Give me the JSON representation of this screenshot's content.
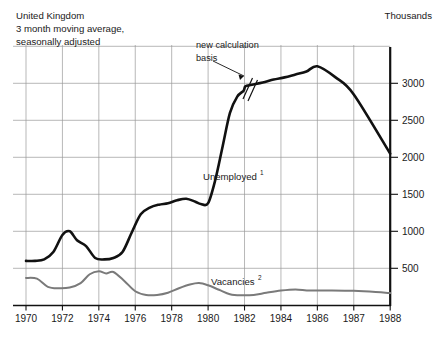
{
  "header": {
    "caption_lines": [
      "United Kingdom",
      "3 month moving average,",
      "seasonally adjusted"
    ],
    "units_label": "Thousands"
  },
  "annotations": [
    {
      "name": "new-calculation-basis",
      "line1": "new calculation",
      "line2": "basis",
      "marker": "axis-break-slashes",
      "points_to_year": 1982
    }
  ],
  "series_labels": {
    "unemployed": "Unemployed",
    "unemployed_footnote": "1",
    "vacancies": "Vacancies",
    "vacancies_footnote": "2"
  },
  "colors": {
    "unemployed_line": "#111111",
    "vacancies_line": "#7a7a7a",
    "grid": "#9a9a9a",
    "axis": "#111111",
    "background": "#ffffff",
    "text": "#1a1a1a"
  },
  "chart_data": {
    "type": "line",
    "title": "United Kingdom",
    "subtitle": "3 month moving average, seasonally adjusted",
    "xlabel": "",
    "ylabel": "Thousands",
    "ylim": [
      0,
      3500
    ],
    "yticks": [
      500,
      1000,
      1500,
      2000,
      2500,
      3000
    ],
    "ytick_labels": [
      "500",
      "1000",
      "1500",
      "2000",
      "2500",
      "3000"
    ],
    "y_axis_position": "right",
    "xticks": [
      1970,
      1972,
      1974,
      1976,
      1978,
      1980,
      1982,
      1984,
      1986,
      1987,
      1988
    ],
    "xtick_labels": [
      "1970",
      "1972",
      "1974",
      "1976",
      "1978",
      "1980",
      "1982",
      "1984",
      "1986",
      "1987",
      "1988"
    ],
    "x_axis_nonuniform": true,
    "grid": true,
    "legend": "inline-labels",
    "series": [
      {
        "name": "Unemployed",
        "footnote": "1",
        "color": "#111111",
        "width": 2.6,
        "x": [
          1970.0,
          1970.5,
          1971.0,
          1971.5,
          1972.0,
          1972.4,
          1972.8,
          1973.3,
          1973.8,
          1974.3,
          1974.8,
          1975.3,
          1975.8,
          1976.3,
          1976.8,
          1977.3,
          1977.8,
          1978.3,
          1978.8,
          1979.3,
          1979.6,
          1980.0,
          1980.4,
          1980.8,
          1981.2,
          1981.6,
          1981.95,
          1982.05,
          1982.4,
          1983.0,
          1983.6,
          1984.2,
          1984.8,
          1985.4,
          1986.0,
          1986.5,
          1987.0,
          1988.0
        ],
        "values": [
          600,
          600,
          620,
          720,
          950,
          1000,
          880,
          800,
          640,
          620,
          640,
          720,
          980,
          1230,
          1320,
          1360,
          1380,
          1420,
          1440,
          1400,
          1370,
          1380,
          1700,
          2150,
          2600,
          2820,
          2900,
          2960,
          2980,
          3010,
          3050,
          3080,
          3120,
          3160,
          3230,
          3080,
          2850,
          2050
        ]
      },
      {
        "name": "Vacancies",
        "footnote": "2",
        "color": "#7a7a7a",
        "width": 2.0,
        "x": [
          1970.0,
          1970.6,
          1971.2,
          1971.8,
          1972.4,
          1973.0,
          1973.5,
          1974.0,
          1974.4,
          1974.8,
          1975.4,
          1976.0,
          1976.6,
          1977.2,
          1977.8,
          1978.4,
          1979.0,
          1979.5,
          1980.0,
          1980.6,
          1981.2,
          1981.8,
          1982.5,
          1983.2,
          1984.0,
          1984.8,
          1985.6,
          1986.4,
          1987.0,
          1987.6,
          1988.0
        ],
        "values": [
          370,
          360,
          250,
          230,
          240,
          300,
          420,
          460,
          430,
          450,
          330,
          190,
          140,
          140,
          170,
          230,
          280,
          300,
          270,
          210,
          150,
          135,
          140,
          170,
          200,
          215,
          200,
          200,
          195,
          180,
          165
        ]
      }
    ]
  }
}
